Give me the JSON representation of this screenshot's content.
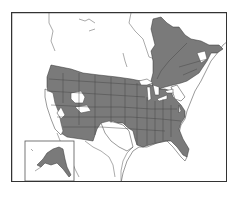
{
  "map": {
    "type": "species-range-map",
    "region": "North America",
    "colors": {
      "range_fill": "#7a7a7a",
      "land_fill": "#ffffff",
      "border_stroke": "#333333",
      "frame_stroke": "#333333"
    },
    "legend": [],
    "range_regions": [
      "Alaska",
      "Quebec",
      "Atlantic Canada",
      "Pacific Northwest",
      "Northern Rockies",
      "Great Plains",
      "Midwest",
      "Great Lakes",
      "Southeast",
      "Florida",
      "Southwest (Arizona, New Mexico)",
      "Colorado Plateau"
    ],
    "excluded_regions": [
      "California",
      "Nevada (western)",
      "Southern Wyoming patch",
      "Southern Utah patch",
      "New England (parts)",
      "Texas (most)",
      "Mexico",
      "Northern Canada / Nunavut"
    ],
    "insets": [
      {
        "label": "Alaska",
        "position": "bottom-left"
      }
    ]
  }
}
